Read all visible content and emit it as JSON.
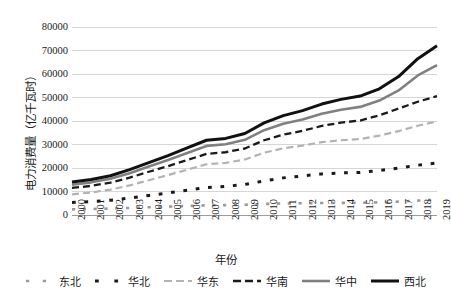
{
  "chart_data": {
    "type": "line",
    "title": "",
    "xlabel": "年份",
    "ylabel": "电力消费量（亿千瓦时）",
    "grid": true,
    "legend_position": "bottom",
    "ylim": [
      0,
      80000
    ],
    "yticks": [
      0,
      10000,
      20000,
      30000,
      40000,
      50000,
      60000,
      70000,
      80000
    ],
    "categories": [
      "2000",
      "2001",
      "2002",
      "2003",
      "2004",
      "2005",
      "2006",
      "2007",
      "2008",
      "2009",
      "2010",
      "2011",
      "2012",
      "2013",
      "2014",
      "2015",
      "2016",
      "2017",
      "2018",
      "2019"
    ],
    "series": [
      {
        "name": "东北",
        "style": "dotted",
        "color": "#9a9a9a",
        "width": 2.6,
        "values": [
          2400,
          2550,
          2750,
          3000,
          3300,
          3550,
          3850,
          4100,
          4200,
          4350,
          4700,
          4900,
          5000,
          5100,
          5150,
          5200,
          5400,
          5700,
          6100,
          6500
        ]
      },
      {
        "name": "华北",
        "style": "dotted",
        "color": "#1a1a1a",
        "width": 3.0,
        "values": [
          5300,
          5700,
          6300,
          7200,
          8300,
          9400,
          10500,
          11700,
          12200,
          13000,
          14500,
          15800,
          16600,
          17500,
          17900,
          18100,
          18900,
          20000,
          21200,
          22100
        ]
      },
      {
        "name": "华东",
        "style": "dashed",
        "color": "#b3b3b3",
        "width": 2.2,
        "values": [
          8800,
          9600,
          10800,
          12600,
          14800,
          17000,
          19300,
          21600,
          22200,
          23600,
          26500,
          28400,
          29500,
          31000,
          31800,
          32300,
          33800,
          35700,
          38000,
          39800
        ]
      },
      {
        "name": "华南",
        "style": "dashed",
        "color": "#1a1a1a",
        "width": 2.3,
        "values": [
          11500,
          12400,
          13800,
          15900,
          18400,
          20800,
          23400,
          26000,
          26700,
          28300,
          31800,
          34200,
          35800,
          37900,
          39300,
          40200,
          42400,
          45300,
          48200,
          50600
        ]
      },
      {
        "name": "华中",
        "style": "solid",
        "color": "#808080",
        "width": 2.6,
        "values": [
          12900,
          13900,
          15400,
          17800,
          20600,
          23400,
          26400,
          29400,
          30100,
          32000,
          36100,
          38800,
          40600,
          43100,
          44800,
          46000,
          48700,
          53000,
          59400,
          63800
        ]
      },
      {
        "name": "西北",
        "style": "solid",
        "color": "#111111",
        "width": 3.0,
        "values": [
          14000,
          15100,
          16700,
          19300,
          22300,
          25300,
          28600,
          31800,
          32600,
          34700,
          39200,
          42300,
          44400,
          47200,
          49200,
          50600,
          53700,
          58900,
          66500,
          72000
        ]
      }
    ]
  },
  "legend": {
    "items": [
      {
        "label": "东北"
      },
      {
        "label": "华北"
      },
      {
        "label": "华东"
      },
      {
        "label": "华南"
      },
      {
        "label": "华中"
      },
      {
        "label": "西北"
      }
    ]
  }
}
